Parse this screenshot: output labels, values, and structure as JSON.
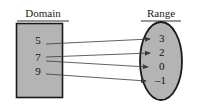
{
  "diagram": {
    "type": "mapping-diagram",
    "width": 198,
    "height": 109,
    "background_color": "#ffffff",
    "shape_fill_color": "#b4b4b4",
    "shape_stroke_color": "#1a1a1a",
    "arrow_color": "#3a3a3a",
    "text_color": "#111111"
  },
  "domain": {
    "label": "Domain",
    "shape": "rectangle",
    "values": [
      {
        "text": "5",
        "x": 38,
        "y": 41
      },
      {
        "text": "7",
        "x": 38,
        "y": 58
      },
      {
        "text": "9",
        "x": 38,
        "y": 72
      }
    ]
  },
  "range": {
    "label": "Range",
    "shape": "ellipse",
    "values": [
      {
        "text": "3",
        "x": 159,
        "y": 39
      },
      {
        "text": "2",
        "x": 159,
        "y": 53
      },
      {
        "text": "0",
        "x": 159,
        "y": 67
      },
      {
        "text": "–1",
        "x": 155,
        "y": 81
      }
    ]
  },
  "mappings": [
    {
      "from": "5",
      "to": "3",
      "x1": 46,
      "y1": 44,
      "x2": 150,
      "y2": 39
    },
    {
      "from": "7",
      "to": "2",
      "x1": 46,
      "y1": 57,
      "x2": 150,
      "y2": 53
    },
    {
      "from": "7",
      "to": "0",
      "x1": 46,
      "y1": 61,
      "x2": 148,
      "y2": 67
    },
    {
      "from": "9",
      "to": "–1",
      "x1": 46,
      "y1": 74,
      "x2": 146,
      "y2": 81
    }
  ],
  "mapping_summary": "5 maps to 3; 7 maps to 2 and 0; 9 maps to -1"
}
